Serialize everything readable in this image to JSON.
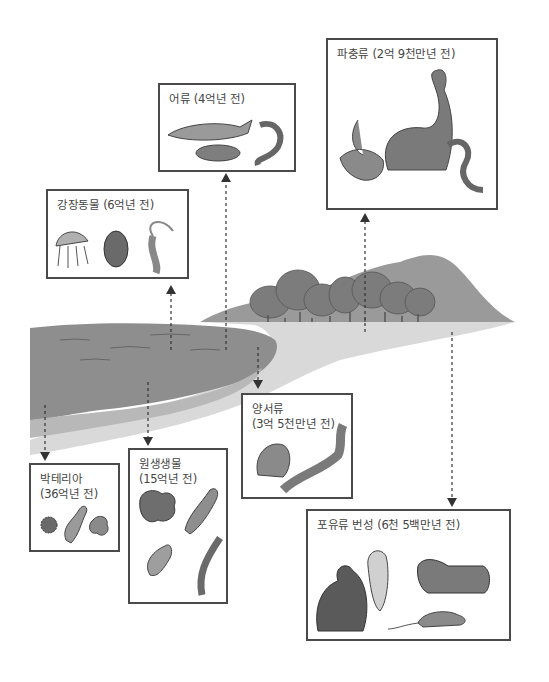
{
  "figure": {
    "colors": {
      "ink": "#4a4a4a",
      "water": "#8c8c8c",
      "land": "#c8c8c8",
      "forest": "#7a7a7a",
      "background": "#ffffff"
    }
  },
  "stages": [
    {
      "id": "bacteria",
      "label_line1": "박테리아",
      "label_line2": "(36억년 전)",
      "arrow": "down"
    },
    {
      "id": "protists",
      "label_line1": "원생생물",
      "label_line2": "(15억년 전)",
      "arrow": "down"
    },
    {
      "id": "coelenterates",
      "label_line1": "강장동물 (6억년 전)",
      "arrow": "up"
    },
    {
      "id": "fish",
      "label_line1": "어류 (4억년 전)",
      "arrow": "up"
    },
    {
      "id": "amphibians",
      "label_line1": "양서류",
      "label_line2": "(3억 5천만년 전)",
      "arrow": "down"
    },
    {
      "id": "reptiles",
      "label_line1": "파충류 (2억 9천만년 전)",
      "arrow": "up"
    },
    {
      "id": "mammals",
      "label_line1": "포유류 번성 (6천 5백만년 전)",
      "arrow": "down"
    }
  ],
  "icons": {
    "bacteria": [
      "spiky-ball-icon",
      "rod-cell-icon",
      "blob-cell-icon"
    ],
    "protists": [
      "amoeba-icon",
      "paramecium-icon",
      "euglena-icon",
      "seaweed-icon"
    ],
    "coelenterates": [
      "jellyfish-icon",
      "trilobite-icon",
      "hydra-icon"
    ],
    "fish": [
      "shark-icon",
      "lungfish-icon",
      "eel-icon"
    ],
    "amphibians": [
      "frog-icon",
      "salamander-icon"
    ],
    "reptiles": [
      "dinosaur-icon",
      "lizard-icon",
      "snake-icon"
    ],
    "mammals": [
      "orangutan-icon",
      "monkey-icon",
      "tiger-icon",
      "rat-icon"
    ]
  }
}
